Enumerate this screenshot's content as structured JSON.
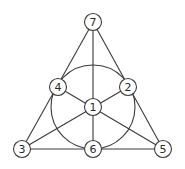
{
  "diagram": {
    "title": "",
    "nodes": [
      {
        "id": "1",
        "label": "1",
        "x": 93,
        "y": 107
      },
      {
        "id": "2",
        "label": "2",
        "x": 128,
        "y": 87
      },
      {
        "id": "3",
        "label": "3",
        "x": 22,
        "y": 149
      },
      {
        "id": "4",
        "label": "4",
        "x": 58,
        "y": 87
      },
      {
        "id": "5",
        "label": "5",
        "x": 163,
        "y": 149
      },
      {
        "id": "6",
        "label": "6",
        "x": 93,
        "y": 149
      },
      {
        "id": "7",
        "label": "7",
        "x": 93,
        "y": 22
      }
    ],
    "lines": [
      [
        "7",
        "4",
        "3"
      ],
      [
        "7",
        "2",
        "5"
      ],
      [
        "3",
        "6",
        "5"
      ],
      [
        "7",
        "1",
        "6"
      ],
      [
        "4",
        "1",
        "5"
      ],
      [
        "2",
        "1",
        "3"
      ]
    ],
    "circle": {
      "through": [
        "4",
        "2",
        "6"
      ],
      "cx": 93,
      "cy": 107,
      "r": 42
    },
    "colors": {
      "stroke": "#3a3a3a",
      "fill": "#ffffff",
      "text": "#2a2a2a"
    }
  }
}
